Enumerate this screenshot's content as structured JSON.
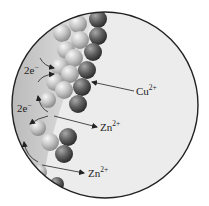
{
  "diagram": {
    "colors": {
      "background": "#ffffff",
      "circle_fill": "#ececec",
      "circle_stroke": "#222222",
      "zinc_band_dark": "#b8b8b8",
      "zinc_band_light": "#e6e6e6",
      "zinc_sphere_light": "#f4f4f4",
      "zinc_sphere_mid": "#a9a9a9",
      "copper_sphere_light": "#9a9a9a",
      "copper_sphere_dark": "#3a3a3a",
      "arrow": "#222222"
    },
    "circle": {
      "cx": 105,
      "cy": 105,
      "r": 93
    },
    "zinc_spheres": [
      {
        "cx": 78,
        "cy": 24,
        "r": 9
      },
      {
        "cx": 62,
        "cy": 33,
        "r": 9
      },
      {
        "cx": 80,
        "cy": 40,
        "r": 9
      },
      {
        "cx": 66,
        "cy": 50,
        "r": 9
      },
      {
        "cx": 74,
        "cy": 58,
        "r": 9
      },
      {
        "cx": 60,
        "cy": 67,
        "r": 9
      },
      {
        "cx": 70,
        "cy": 74,
        "r": 9
      },
      {
        "cx": 55,
        "cy": 82,
        "r": 9
      },
      {
        "cx": 64,
        "cy": 90,
        "r": 9
      },
      {
        "cx": 48,
        "cy": 100,
        "r": 8
      },
      {
        "cx": 38,
        "cy": 128,
        "r": 8
      },
      {
        "cx": 50,
        "cy": 142,
        "r": 9
      },
      {
        "cx": 40,
        "cy": 172,
        "r": 7
      }
    ],
    "copper_spheres": [
      {
        "cx": 98,
        "cy": 19,
        "r": 9
      },
      {
        "cx": 98,
        "cy": 36,
        "r": 9
      },
      {
        "cx": 93,
        "cy": 52,
        "r": 9
      },
      {
        "cx": 87,
        "cy": 70,
        "r": 9
      },
      {
        "cx": 82,
        "cy": 87,
        "r": 9
      },
      {
        "cx": 78,
        "cy": 104,
        "r": 9
      },
      {
        "cx": 68,
        "cy": 137,
        "r": 9
      },
      {
        "cx": 64,
        "cy": 154,
        "r": 9
      },
      {
        "cx": 57,
        "cy": 184,
        "r": 7
      }
    ],
    "labels": {
      "electrons_1": {
        "base": "2e",
        "sup": "−",
        "x": 24,
        "y": 74
      },
      "electrons_2": {
        "base": "2e",
        "sup": "−",
        "x": 17,
        "y": 112
      },
      "copper_ion": {
        "base": "Cu",
        "sup": "2+",
        "x": 136,
        "y": 95
      },
      "zinc_ion_1": {
        "base": "Zn",
        "sup": "2+",
        "x": 100,
        "y": 131
      },
      "zinc_ion_2": {
        "base": "Zn",
        "sup": "2+",
        "x": 88,
        "y": 177
      }
    }
  }
}
